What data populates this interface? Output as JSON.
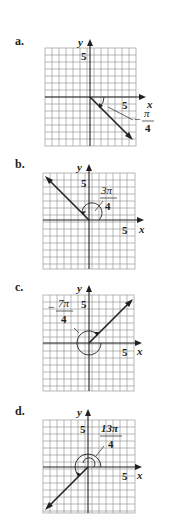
{
  "grid": {
    "cell": 7,
    "cols": 13,
    "rows": 14,
    "color": "#8a8a8a"
  },
  "panels": [
    {
      "id": "a",
      "label": "a.",
      "top": 30,
      "origin_col": 6.4,
      "origin_row": 7,
      "angle_label_num": "π",
      "angle_label_den": "4",
      "angle_label_sign": "−",
      "angle_text": "-π/4",
      "terminal_deg": -45,
      "x_axis_label": "x",
      "y_axis_label": "y",
      "tick_label_x": "5",
      "tick_label_y": "5"
    },
    {
      "id": "b",
      "label": "b.",
      "top": 153,
      "origin_col": 6.6,
      "origin_row": 7,
      "angle_label_num": "3π",
      "angle_label_den": "4",
      "angle_label_sign": "",
      "angle_text": "3π/4",
      "terminal_deg": 135,
      "x_axis_label": "x",
      "y_axis_label": "y",
      "tick_label_x": "5",
      "tick_label_y": "5"
    },
    {
      "id": "c",
      "label": "c.",
      "top": 276,
      "origin_col": 6.6,
      "origin_row": 7,
      "angle_label_num": "7π",
      "angle_label_den": "4",
      "angle_label_sign": "−",
      "angle_text": "-7π/4",
      "terminal_deg": 45,
      "x_axis_label": "x",
      "y_axis_label": "y",
      "tick_label_x": "5",
      "tick_label_y": "5"
    },
    {
      "id": "d",
      "label": "d.",
      "top": 400,
      "origin_col": 6.5,
      "origin_row": 6.7,
      "angle_label_num": "13π",
      "angle_label_den": "4",
      "angle_label_sign": "",
      "angle_text": "13π/4",
      "terminal_deg": 225,
      "x_axis_label": "x",
      "y_axis_label": "y",
      "tick_label_x": "5",
      "tick_label_y": "5"
    }
  ]
}
